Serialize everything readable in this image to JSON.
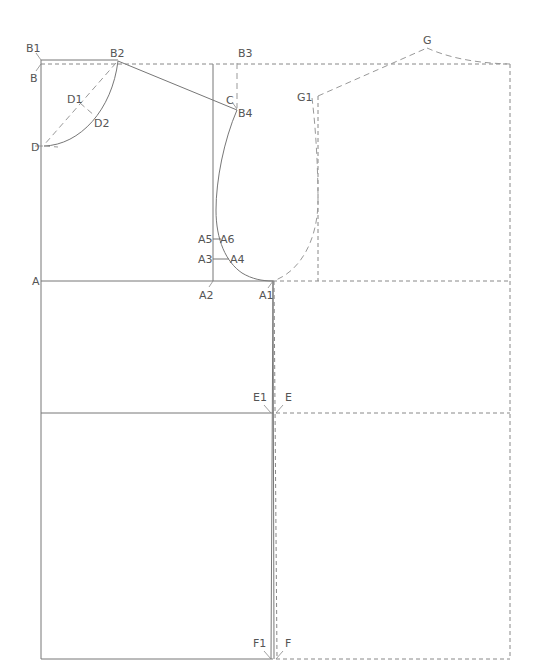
{
  "diagram": {
    "colors": {
      "solid_line": "#777777",
      "dashed_line": "#888888",
      "label": "#555555",
      "background": "#ffffff"
    },
    "points": [
      {
        "id": "B1",
        "label": "B1",
        "x": 41,
        "y": 60
      },
      {
        "id": "B",
        "label": "B",
        "x": 41,
        "y": 64
      },
      {
        "id": "B2",
        "label": "B2",
        "x": 118,
        "y": 61
      },
      {
        "id": "B3",
        "label": "B3",
        "x": 237,
        "y": 63
      },
      {
        "id": "C",
        "label": "C",
        "x": 237,
        "y": 108
      },
      {
        "id": "B4",
        "label": "B4",
        "x": 237,
        "y": 110
      },
      {
        "id": "D1",
        "label": "D1",
        "x": 81,
        "y": 101
      },
      {
        "id": "D2",
        "label": "D2",
        "x": 95,
        "y": 115
      },
      {
        "id": "D",
        "label": "D",
        "x": 43,
        "y": 146
      },
      {
        "id": "A5",
        "label": "A5",
        "x": 213,
        "y": 239
      },
      {
        "id": "A6",
        "label": "A6",
        "x": 222,
        "y": 239
      },
      {
        "id": "A3",
        "label": "A3",
        "x": 213,
        "y": 259
      },
      {
        "id": "A4",
        "label": "A4",
        "x": 230,
        "y": 259
      },
      {
        "id": "A",
        "label": "A",
        "x": 41,
        "y": 281
      },
      {
        "id": "A2",
        "label": "A2",
        "x": 213,
        "y": 281
      },
      {
        "id": "A1",
        "label": "A1",
        "x": 273,
        "y": 281
      },
      {
        "id": "E1",
        "label": "E1",
        "x": 271,
        "y": 413
      },
      {
        "id": "E",
        "label": "E",
        "x": 276,
        "y": 413
      },
      {
        "id": "F1",
        "label": "F1",
        "x": 271,
        "y": 659
      },
      {
        "id": "F",
        "label": "F",
        "x": 276,
        "y": 659
      },
      {
        "id": "G",
        "label": "G",
        "x": 427,
        "y": 47
      },
      {
        "id": "G1",
        "label": "G1",
        "x": 318,
        "y": 96
      }
    ],
    "labels": {
      "B1": "B1",
      "B": "B",
      "B2": "B2",
      "B3": "B3",
      "C": "C",
      "B4": "B4",
      "D1": "D1",
      "D2": "D2",
      "D": "D",
      "A5": "A5",
      "A6": "A6",
      "A3": "A3",
      "A4": "A4",
      "A": "A",
      "A2": "A2",
      "A1": "A1",
      "E1": "E1",
      "E": "E",
      "F1": "F1",
      "F": "F",
      "G": "G",
      "G1": "G1"
    },
    "line_styles": [
      "solid (back bodice)",
      "dashed (front bodice)"
    ]
  }
}
